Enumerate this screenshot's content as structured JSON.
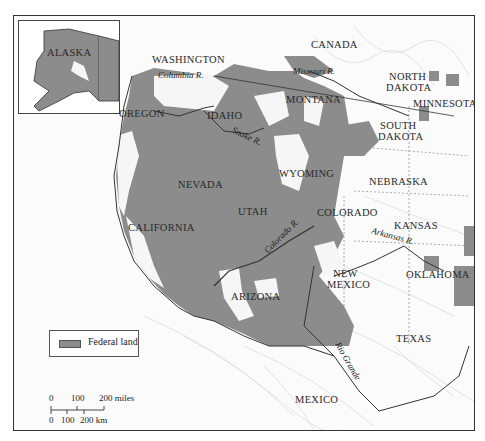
{
  "map": {
    "colors": {
      "federal_land": "#8c8c8c",
      "background": "#fbfbfb",
      "border": "#333333",
      "terrain_lines": "#cfcfcf"
    },
    "inset": {
      "label": "ALASKA"
    },
    "countries": {
      "canada": "CANADA",
      "mexico": "MEXICO"
    },
    "states": {
      "washington": "WASHINGTON",
      "oregon": "OREGON",
      "idaho": "IDAHO",
      "montana": "MONTANA",
      "north_dakota_1": "NORTH",
      "north_dakota_2": "DAKOTA",
      "south_dakota_1": "SOUTH",
      "south_dakota_2": "DAKOTA",
      "minnesota": "MINNESOTA",
      "wyoming": "WYOMING",
      "nevada": "NEVADA",
      "utah": "UTAH",
      "colorado": "COLORADO",
      "nebraska": "NEBRASKA",
      "kansas": "KANSAS",
      "california": "CALIFORNIA",
      "arizona": "ARIZONA",
      "new_mexico_1": "NEW",
      "new_mexico_2": "MEXICO",
      "oklahoma": "OKLAHOMA",
      "texas": "TEXAS"
    },
    "rivers": {
      "columbia": "Columbia R.",
      "missouri": "Missouri R.",
      "snake": "Snake R.",
      "colorado": "Colorado R.",
      "arkansas": "Arkansas R.",
      "rio_grande": "Rio Grande"
    },
    "legend": {
      "items": [
        {
          "label": "Federal land",
          "color": "#8c8c8c"
        }
      ]
    },
    "scale_bar": {
      "miles_labels": [
        "0",
        "100",
        "200 miles"
      ],
      "km_labels": [
        "0",
        "100",
        "200 km"
      ]
    }
  }
}
